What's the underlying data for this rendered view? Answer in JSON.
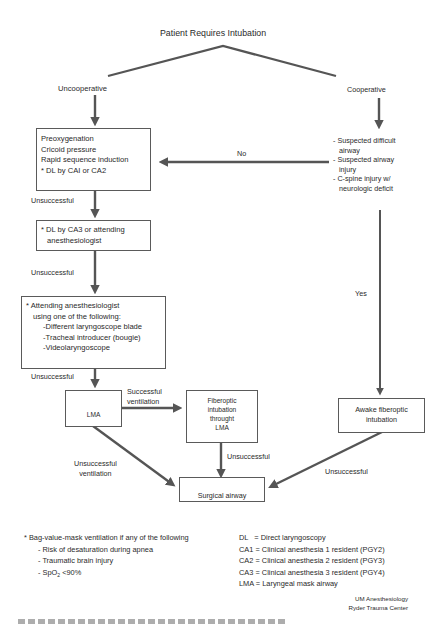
{
  "title": "Patient Requires Intubation",
  "branches": {
    "left": "Uncooperative",
    "right": "Cooperative"
  },
  "boxes": {
    "initial": {
      "lines": [
        "Preoxygenation",
        "Cricoid pressure",
        "Rapid sequence induction",
        "* DL by CAI or CA2"
      ]
    },
    "second": {
      "lines": [
        "* DL by CA3 or attending",
        "anesthesiologist"
      ]
    },
    "third": {
      "lines": [
        "* Attending anesthesiologist",
        "using one of the following:",
        "-Different laryngoscope blade",
        "-Tracheal introducer (bougie)",
        "-Videolaryngoscope"
      ]
    },
    "lma": {
      "label": "LMA"
    },
    "fiberoptic_lma": {
      "lines": [
        "Fiberoptic",
        "intubation",
        "throught",
        "LMA"
      ]
    },
    "awake_fiberoptic": {
      "lines": [
        "Awake fiberoptic",
        "intubation"
      ]
    },
    "surgical_airway": {
      "label": "Surgical airway"
    }
  },
  "criteria": {
    "lines": [
      "- Suspected difficult",
      "airway",
      "- Suspected airway",
      "injury",
      "- C-spine injury w/",
      "neurologic deficit"
    ]
  },
  "edge_labels": {
    "no": "No",
    "yes": "Yes",
    "unsuccessful_1": "Unsuccessful",
    "unsuccessful_2": "Unsuccessful",
    "unsuccessful_3": "Unsuccessful",
    "successful_ventilation": [
      "Successful",
      "ventilation"
    ],
    "unsuccessful_ventilation": [
      "Unsuccessful",
      "ventilation"
    ],
    "unsuccessful_fiberoptic": "Unsuccessful",
    "unsuccessful_awake": "Unsuccessful"
  },
  "footnote": {
    "heading": "* Bag-value-mask ventilation if any of the following",
    "items": [
      "- Risk of desaturation during apnea",
      "- Traumatic brain injury",
      "- SpO",
      "2",
      " <90%"
    ]
  },
  "legend": [
    "DL   = Direct laryngoscopy",
    "CA1 = Clinical anesthesia 1 resident (PGY2)",
    "CA2 = Clinical anesthesia 2 resident (PGY3)",
    "CA3 = Clinical anesthesia 3 resident (PGY4)",
    "LMA = Laryngeal mask airway"
  ],
  "credit": [
    "UM Anesthesiology",
    "Ryder Trauma Center"
  ],
  "colors": {
    "arrow": "#555555",
    "box_border": "#5a5a5a",
    "text": "#2a2a2a"
  }
}
